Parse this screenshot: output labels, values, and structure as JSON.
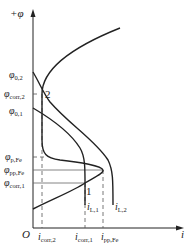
{
  "diagram": {
    "axes": {
      "y_label": "+φ",
      "x_label": "i",
      "origin_label": "O"
    },
    "potential_labels": [
      {
        "sym": "φ",
        "sub": "0,2",
        "y": 75
      },
      {
        "sym": "φ",
        "sub": "corr,2",
        "y": 94
      },
      {
        "sym": "φ",
        "sub": "0,1",
        "y": 111
      },
      {
        "sym": "φ",
        "sub": "p,Fe",
        "y": 157
      },
      {
        "sym": "φ",
        "sub": "pp,Fe",
        "y": 170
      },
      {
        "sym": "φ",
        "sub": "corr,1",
        "y": 183
      }
    ],
    "current_labels": [
      {
        "sym": "i",
        "sub": "corr,2",
        "x": 42
      },
      {
        "sym": "i",
        "sub": "corr,1",
        "x": 85
      },
      {
        "sym": "i",
        "sub": "pp,Fe",
        "x": 103
      }
    ],
    "limit_labels": [
      {
        "sym": "i",
        "sub": "L,1"
      },
      {
        "sym": "i",
        "sub": "L,2"
      }
    ],
    "points": [
      {
        "label": "1"
      },
      {
        "label": "2"
      }
    ],
    "curves": [
      "anodic polarization curve of Fe (active-passive)",
      "cathodic curve 1 (limiting current iL,1)",
      "cathodic curve 2 (limiting current iL,2)"
    ],
    "colors": {
      "line": "#222222",
      "guide": "#555555"
    }
  }
}
